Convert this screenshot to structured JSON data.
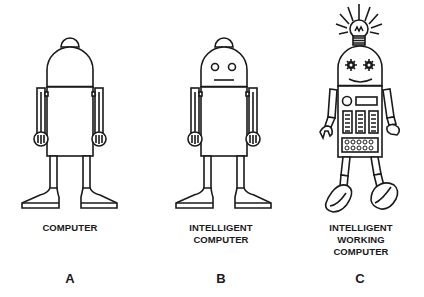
{
  "figures": [
    {
      "id": "A",
      "letter": "A",
      "caption_lines": [
        "COMPUTER"
      ],
      "features": [
        "plain-head",
        "straight-arms",
        "standing"
      ]
    },
    {
      "id": "B",
      "letter": "B",
      "caption_lines": [
        "INTELLIGENT",
        "COMPUTER"
      ],
      "features": [
        "eyes",
        "flat-mouth",
        "straight-arms",
        "standing"
      ]
    },
    {
      "id": "C",
      "letter": "C",
      "caption_lines": [
        "INTELLIGENT",
        "WORKING",
        "COMPUTER"
      ],
      "features": [
        "light-bulb",
        "gear-eyes",
        "smile",
        "keypad-body",
        "bent-arms",
        "walking"
      ]
    }
  ],
  "colors": {
    "ink": "#1a1a1a",
    "background": "#ffffff"
  }
}
